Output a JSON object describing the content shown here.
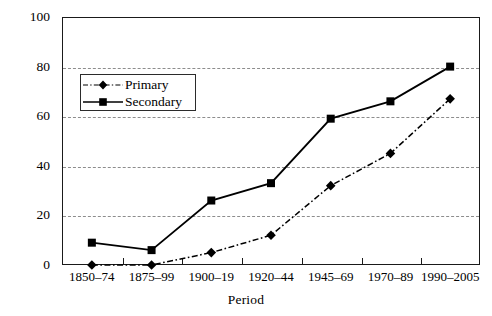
{
  "chart_data": {
    "type": "line",
    "title": "",
    "xlabel": "Period",
    "ylabel": "Percent",
    "categories": [
      "1850–74",
      "1875–99",
      "1900–19",
      "1920–44",
      "1945–69",
      "1970–89",
      "1990–2005"
    ],
    "ylim": [
      0,
      100
    ],
    "yticks": [
      0,
      20,
      40,
      60,
      80,
      100
    ],
    "grid": "horizontal-dashed",
    "legend_position": "upper-left-inside",
    "series": [
      {
        "name": "Primary",
        "marker": "diamond",
        "line_style": "dash-dot",
        "color": "#000000",
        "values": [
          0,
          0,
          5,
          12,
          32,
          45,
          67
        ]
      },
      {
        "name": "Secondary",
        "marker": "square",
        "line_style": "solid",
        "color": "#000000",
        "values": [
          9,
          6,
          26,
          33,
          59,
          66,
          80
        ]
      }
    ]
  },
  "axis": {
    "y_title": "Percent",
    "x_title": "Period",
    "y_tick_labels": [
      "0",
      "20",
      "40",
      "60",
      "80",
      "100"
    ],
    "x_tick_labels": [
      "1850–74",
      "1875–99",
      "1900–19",
      "1920–44",
      "1945–69",
      "1970–89",
      "1990–2005"
    ]
  },
  "legend": {
    "items": [
      {
        "label": "Primary"
      },
      {
        "label": "Secondary"
      }
    ]
  }
}
